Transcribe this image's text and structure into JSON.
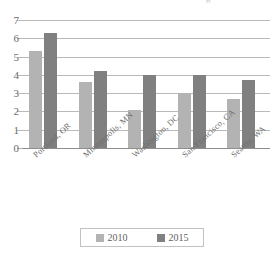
{
  "title_remnant": "g",
  "chart_data": {
    "type": "bar",
    "title": "",
    "xlabel": "",
    "ylabel": "",
    "ylim": [
      0,
      7
    ],
    "yticks": [
      0,
      1,
      2,
      3,
      4,
      5,
      6,
      7
    ],
    "ytick_labels": [
      "0",
      "1",
      "2",
      "3",
      "4",
      "5",
      "6",
      "7"
    ],
    "grid": true,
    "legend_position": "bottom",
    "categories": [
      "Portland, OR",
      "Minneapolis, MN",
      "Washington, DC",
      "San Francisco, CA",
      "Seattle, WA"
    ],
    "series": [
      {
        "name": "2010",
        "color": "#b3b3b3",
        "values": [
          5.3,
          3.6,
          2.1,
          3.0,
          2.7
        ]
      },
      {
        "name": "2015",
        "color": "#808080",
        "values": [
          6.3,
          4.2,
          4.0,
          4.0,
          3.7
        ]
      }
    ]
  },
  "legend": {
    "items": [
      {
        "label": "2010",
        "color": "#b3b3b3"
      },
      {
        "label": "2015",
        "color": "#808080"
      }
    ]
  }
}
